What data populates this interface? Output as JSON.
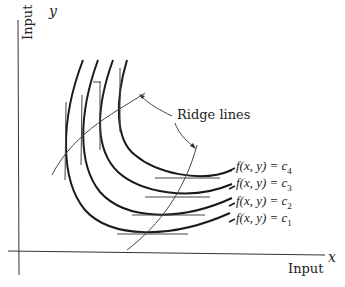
{
  "diagram": {
    "axes": {
      "y": {
        "symbol": "y",
        "label": "Input"
      },
      "x": {
        "symbol": "x",
        "label": "Input"
      }
    },
    "annotation": "Ridge lines",
    "isoquants": [
      {
        "id": "c4",
        "label": "f(x, y) = c",
        "sub": "4"
      },
      {
        "id": "c3",
        "label": "f(x, y) = c",
        "sub": "3"
      },
      {
        "id": "c2",
        "label": "f(x, y) = c",
        "sub": "2"
      },
      {
        "id": "c1",
        "label": "f(x, y) = c",
        "sub": "1"
      }
    ],
    "colors": {
      "ink": "#1a1a1a",
      "thin": "#444444"
    }
  }
}
